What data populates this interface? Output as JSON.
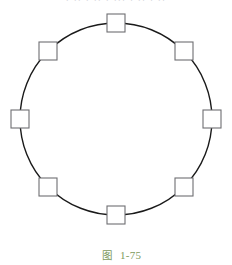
{
  "page": {
    "width": 232,
    "height": 255,
    "background": "#ffffff"
  },
  "clipped_header": {
    "text": "· ·· · ·· · ··· · ·· · ··",
    "color": "#c9ccd2",
    "note": "illegible clipped text row at top edge"
  },
  "caption": {
    "label": "图",
    "number": "1-75",
    "full_text": "图  1-75",
    "color": "#7d9a5c"
  },
  "figure": {
    "type": "geometry-diagram",
    "circle": {
      "cx": 116,
      "cy": 119,
      "r": 96,
      "stroke": "#1a1a1a",
      "stroke_width": 1.4,
      "fill": "none"
    },
    "square_style": {
      "size": 18,
      "stroke": "#6e6e72",
      "stroke_width": 1.1,
      "fill": "#ffffff"
    },
    "squares": [
      {
        "name": "square-top",
        "angle_deg": 90,
        "cx": 116,
        "cy": 23
      },
      {
        "name": "square-top-right",
        "angle_deg": 45,
        "cx": 184,
        "cy": 51
      },
      {
        "name": "square-right",
        "angle_deg": 0,
        "cx": 212,
        "cy": 119
      },
      {
        "name": "square-bottom-right",
        "angle_deg": 315,
        "cx": 184,
        "cy": 187
      },
      {
        "name": "square-bottom",
        "angle_deg": 270,
        "cx": 116,
        "cy": 215
      },
      {
        "name": "square-bottom-left",
        "angle_deg": 225,
        "cx": 48,
        "cy": 187
      },
      {
        "name": "square-left",
        "angle_deg": 180,
        "cx": 20,
        "cy": 119
      },
      {
        "name": "square-top-left",
        "angle_deg": 135,
        "cx": 48,
        "cy": 51
      }
    ]
  }
}
